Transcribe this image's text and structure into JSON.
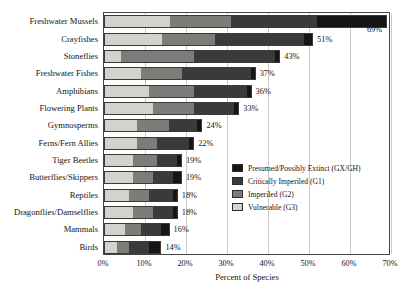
{
  "chart_data": {
    "type": "bar",
    "orientation": "horizontal",
    "stacked": true,
    "title": "",
    "xlabel": "Percent of Species",
    "ylabel": "",
    "xlim": [
      0,
      70
    ],
    "xticks": [
      "0%",
      "10%",
      "20%",
      "30%",
      "40%",
      "50%",
      "60%",
      "70%"
    ],
    "xtick_values": [
      0,
      10,
      20,
      30,
      40,
      50,
      60,
      70
    ],
    "grid": true,
    "legend_position": "inside-right",
    "series": [
      {
        "name": "Vulnerable (G3)",
        "key": "g3",
        "color": "#d4d2cd",
        "values": [
          16,
          14,
          4,
          9,
          11,
          12,
          8,
          8,
          7,
          7,
          6,
          7,
          5,
          3
        ]
      },
      {
        "name": "Imperiled (G2)",
        "key": "g2",
        "color": "#7e7c78",
        "values": [
          15,
          13,
          18,
          10,
          11,
          10,
          8,
          5,
          6,
          5,
          5,
          5,
          4,
          3
        ]
      },
      {
        "name": "Critically Imperiled (G1)",
        "key": "g1",
        "color": "#3b3a38",
        "values": [
          21,
          22,
          20,
          17,
          13,
          10,
          7,
          8,
          5,
          5,
          6,
          5,
          5,
          5
        ]
      },
      {
        "name": "Presumed/Possibly Extinct (GX/GH)",
        "key": "gx",
        "color": "#161514",
        "values": [
          17,
          2,
          1,
          1,
          1,
          1,
          1,
          1,
          1,
          2,
          1,
          1,
          2,
          3
        ]
      }
    ],
    "categories": [
      "Freshwater Mussels",
      "Crayfishes",
      "Stoneflies",
      "Freshwater Fishes",
      "Amphibians",
      "Flowering Plants",
      "Gymnosperms",
      "Ferns/Fern Allies",
      "Tiger Beetles",
      "Butterflies/Skippers",
      "Reptiles",
      "Dragonflies/Damselflies",
      "Mammals",
      "Birds"
    ],
    "totals": [
      69,
      51,
      43,
      37,
      36,
      33,
      24,
      22,
      19,
      19,
      18,
      18,
      16,
      14
    ],
    "total_labels": [
      "69%",
      "51%",
      "43%",
      "37%",
      "36%",
      "33%",
      "24%",
      "22%",
      "19%",
      "19%",
      "18%",
      "18%",
      "16%",
      "14%"
    ]
  },
  "legend": {
    "items": [
      {
        "label": "Presumed/Possibly Extinct (GX/GH)",
        "key": "gx"
      },
      {
        "label": "Critically Imperiled (G1)",
        "key": "g1"
      },
      {
        "label": "Imperiled (G2)",
        "key": "g2"
      },
      {
        "label": "Vulnerable (G3)",
        "key": "g3"
      }
    ]
  }
}
